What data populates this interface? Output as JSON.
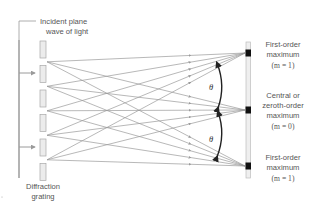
{
  "figure": {
    "type": "diffraction-grating-diagram",
    "labels": {
      "incident": [
        "Incident plane",
        "wave of light"
      ],
      "grating": [
        "Diffraction",
        "grating"
      ],
      "angle_symbol": "θ",
      "maxima": [
        {
          "id": "first-order-top",
          "lines": [
            "First-order",
            "maximum"
          ],
          "order_label": "(m = 1)",
          "m_var": "m",
          "m_val": "1"
        },
        {
          "id": "central",
          "lines": [
            "Central or",
            "zeroth-order",
            "maximum"
          ],
          "order_label": "(m = 0)",
          "m_var": "m",
          "m_val": "0"
        },
        {
          "id": "first-order-bottom",
          "lines": [
            "First-order",
            "maximum"
          ],
          "order_label": "(m = 1)",
          "m_var": "m",
          "m_val": "1"
        }
      ]
    },
    "colors": {
      "rays": "#9a9a9a",
      "slit_fill": "#ececec",
      "slit_stroke": "#a8a8a8",
      "bar": "#8c8c8c",
      "screen": "#c8c8c8",
      "maximum_marker": "#111111",
      "arc": "#222222",
      "text": "#555555"
    },
    "geometry": {
      "slit_count": 6,
      "maxima_count": 3,
      "incident_arrows": 2
    }
  }
}
